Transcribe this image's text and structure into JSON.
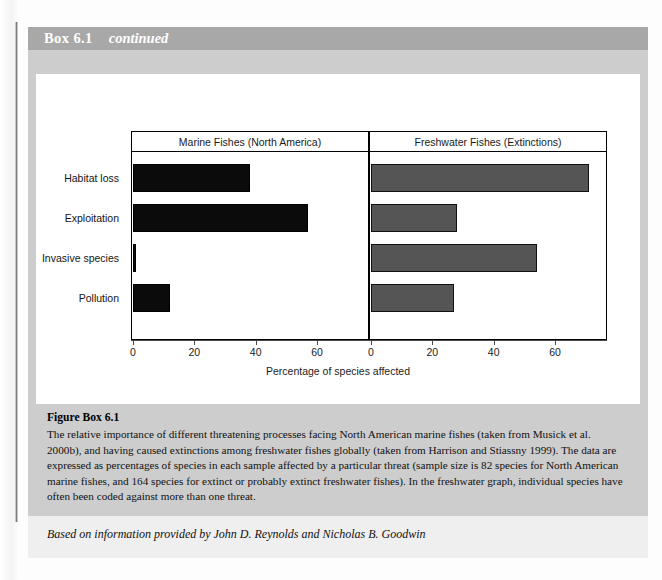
{
  "box": {
    "title": "Box 6.1",
    "continued_label": "continued"
  },
  "figure": {
    "caption_title": "Figure Box 6.1",
    "caption_text": "The relative importance of different threatening processes facing North American marine fishes (taken from Musick et al. 2000b), and having caused extinctions among freshwater fishes globally (taken from Harrison and Stiassny 1999). The data are expressed as percentages of species in each sample affected by a particular threat (sample size is 82 species for North American marine fishes, and 164 species for extinct or probably extinct freshwater fishes). In the freshwater graph, individual species have often been coded against more than one threat."
  },
  "attribution": "Based on information provided by John D. Reynolds and Nicholas B. Goodwin",
  "colors": {
    "header_band": "#a8a8a8",
    "box_body": "#cdcdcd",
    "marine_bar": "#0b0b0b",
    "freshwater_bar": "#555555",
    "frame": "#000000"
  },
  "chart_data": {
    "type": "bar",
    "orientation": "horizontal",
    "title": "",
    "xlabel": "Percentage of species affected",
    "ylabel": "",
    "categories": [
      "Habitat loss",
      "Exploitation",
      "Invasive species",
      "Pollution"
    ],
    "panels": [
      {
        "name": "Marine Fishes (North America)",
        "values": [
          38,
          57,
          1,
          12
        ],
        "color": "#0b0b0b",
        "xlim": [
          0,
          75
        ],
        "xticks": [
          0,
          20,
          40,
          60
        ]
      },
      {
        "name": "Freshwater Fishes (Extinctions)",
        "values": [
          71,
          28,
          54,
          27
        ],
        "color": "#555555",
        "xlim": [
          0,
          75
        ],
        "xticks": [
          0,
          20,
          40,
          60
        ]
      }
    ],
    "grid": false,
    "legend": "none"
  }
}
